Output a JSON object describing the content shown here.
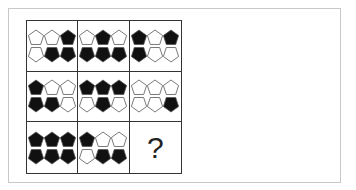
{
  "puzzle": {
    "question_mark": "?",
    "colors": {
      "filled": "#111111",
      "empty": "#ffffff",
      "stroke": "#555555",
      "grid": "#333333",
      "frame": "#c8c8c8"
    },
    "cells": [
      {
        "row": 1,
        "col": 1,
        "TL": 0,
        "BL": 0,
        "CT": 0,
        "CB": 1,
        "TR": 1,
        "BR": 1
      },
      {
        "row": 1,
        "col": 2,
        "TL": 0,
        "BL": 1,
        "CT": 1,
        "CB": 1,
        "TR": 0,
        "BR": 1
      },
      {
        "row": 1,
        "col": 3,
        "TL": 1,
        "BL": 1,
        "CT": 0,
        "CB": 0,
        "TR": 1,
        "BR": 0
      },
      {
        "row": 2,
        "col": 1,
        "TL": 1,
        "BL": 1,
        "CT": 0,
        "CB": 1,
        "TR": 0,
        "BR": 0
      },
      {
        "row": 2,
        "col": 2,
        "TL": 1,
        "BL": 0,
        "CT": 1,
        "CB": 1,
        "TR": 1,
        "BR": 0
      },
      {
        "row": 2,
        "col": 3,
        "TL": 0,
        "BL": 0,
        "CT": 0,
        "CB": 0,
        "TR": 0,
        "BR": 1
      },
      {
        "row": 3,
        "col": 1,
        "TL": 1,
        "BL": 1,
        "CT": 1,
        "CB": 1,
        "TR": 1,
        "BR": 1
      },
      {
        "row": 3,
        "col": 2,
        "TL": 1,
        "BL": 0,
        "CT": 0,
        "CB": 1,
        "TR": 0,
        "BR": 1
      },
      {
        "row": 3,
        "col": 3,
        "unknown": true
      }
    ]
  }
}
